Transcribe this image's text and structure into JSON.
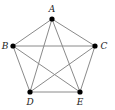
{
  "diagram": {
    "type": "complete-graph",
    "name": "K5",
    "colors": {
      "edge": "#8a8a8a",
      "vertex": "#000000",
      "label": "#222222",
      "background": "#ffffff"
    },
    "vertices": [
      {
        "id": "A",
        "label": "A",
        "x": 52,
        "y": 19,
        "lx": 52,
        "ly": 12,
        "anchor": "middle"
      },
      {
        "id": "B",
        "label": "B",
        "x": 13,
        "y": 46,
        "lx": 5,
        "ly": 49,
        "anchor": "middle"
      },
      {
        "id": "C",
        "label": "C",
        "x": 95,
        "y": 46,
        "lx": 104,
        "ly": 49,
        "anchor": "middle"
      },
      {
        "id": "D",
        "label": "D",
        "x": 30,
        "y": 92,
        "lx": 30,
        "ly": 105,
        "anchor": "middle"
      },
      {
        "id": "E",
        "label": "E",
        "x": 80,
        "y": 92,
        "lx": 80,
        "ly": 105,
        "anchor": "middle"
      }
    ],
    "edges": [
      [
        "A",
        "B"
      ],
      [
        "A",
        "C"
      ],
      [
        "A",
        "D"
      ],
      [
        "A",
        "E"
      ],
      [
        "B",
        "C"
      ],
      [
        "B",
        "D"
      ],
      [
        "B",
        "E"
      ],
      [
        "C",
        "D"
      ],
      [
        "C",
        "E"
      ],
      [
        "D",
        "E"
      ]
    ]
  }
}
